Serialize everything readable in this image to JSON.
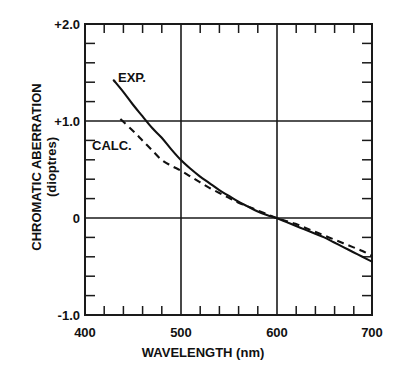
{
  "chart_data": {
    "type": "line",
    "title": "",
    "xlabel": "WAVELENGTH (nm)",
    "ylabel": "CHROMATIC ABERRATION",
    "ylabel_units": "(dioptres)",
    "xlim": [
      400,
      700
    ],
    "ylim": [
      -1.0,
      2.0
    ],
    "grid": true,
    "grid_description": "major gridlines at x=500,600 and y=+1.0,0",
    "xticks": [
      400,
      500,
      600,
      700
    ],
    "xtick_labels": [
      "400",
      "500",
      "600",
      "700"
    ],
    "x_minor_tick_step": 20,
    "yticks": [
      2.0,
      1.0,
      0,
      -1.0
    ],
    "ytick_labels": [
      "+2.0",
      "+1.0",
      "0",
      "-1.0"
    ],
    "y_minor_tick_step": 0.2,
    "legend_position": "inline-annotations",
    "annotations": [
      {
        "name": "EXP.",
        "text": "EXP.",
        "x": 437,
        "y": 1.65
      },
      {
        "name": "CALC.",
        "text": "CALC.",
        "x": 412,
        "y": 0.78
      }
    ],
    "series": [
      {
        "name": "EXP.",
        "label": "EXP.",
        "style": "solid",
        "color": "#111111",
        "x": [
          430,
          440,
          450,
          460,
          470,
          480,
          490,
          500,
          510,
          520,
          530,
          540,
          550,
          560,
          570,
          580,
          590,
          600,
          610,
          620,
          630,
          640,
          650,
          660,
          670,
          680,
          690,
          700
        ],
        "y": [
          1.42,
          1.3,
          1.17,
          1.05,
          0.93,
          0.83,
          0.71,
          0.6,
          0.51,
          0.43,
          0.36,
          0.29,
          0.23,
          0.17,
          0.12,
          0.07,
          0.03,
          0.0,
          -0.04,
          -0.08,
          -0.12,
          -0.16,
          -0.2,
          -0.25,
          -0.3,
          -0.35,
          -0.4,
          -0.45
        ]
      },
      {
        "name": "CALC.",
        "label": "CALC.",
        "style": "dashed",
        "color": "#111111",
        "x": [
          437,
          450,
          460,
          470,
          480,
          490,
          500,
          510,
          520,
          530,
          540,
          550,
          560,
          570,
          580,
          590,
          600,
          610,
          620,
          630,
          640,
          650,
          660,
          670,
          680,
          690,
          700
        ],
        "y": [
          1.02,
          0.9,
          0.8,
          0.7,
          0.6,
          0.54,
          0.49,
          0.43,
          0.37,
          0.31,
          0.26,
          0.21,
          0.16,
          0.12,
          0.08,
          0.04,
          0.0,
          -0.03,
          -0.06,
          -0.1,
          -0.14,
          -0.18,
          -0.22,
          -0.26,
          -0.3,
          -0.34,
          -0.39
        ]
      }
    ]
  },
  "axis": {
    "y_title_main": "CHROMATIC ABERRATION",
    "y_title_sub": "(dioptres)",
    "x_title": "WAVELENGTH (nm)"
  },
  "ticks": {
    "y": [
      {
        "value": "+2.0"
      },
      {
        "value": "+1.0"
      },
      {
        "value": "0"
      },
      {
        "value": "-1.0"
      }
    ],
    "x": [
      {
        "value": "400"
      },
      {
        "value": "500"
      },
      {
        "value": "600"
      },
      {
        "value": "700"
      }
    ]
  },
  "labels": {
    "exp": "EXP.",
    "calc": "CALC."
  }
}
